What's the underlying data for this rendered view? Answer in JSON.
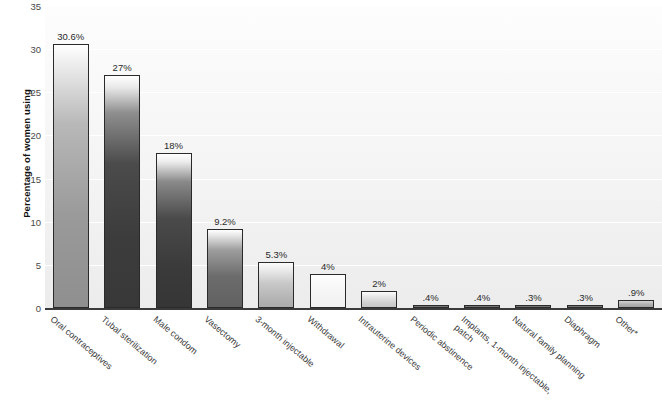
{
  "chart_data": {
    "type": "bar",
    "title": "",
    "xlabel": "",
    "ylabel": "Percentage of women using",
    "ylim": [
      0,
      35
    ],
    "yticks": [
      0,
      5,
      10,
      15,
      20,
      25,
      30,
      35
    ],
    "ytick_labels": [
      "0",
      "5",
      "10",
      "15",
      "20",
      "25",
      "30",
      "35"
    ],
    "grid": true,
    "legend": "none",
    "categories": [
      "Oral contraceptives",
      "Tubal sterilization",
      "Male condom",
      "Vasectomy",
      "3-month injectable",
      "Withdrawal",
      "Intrauterine devices",
      "Periodic abstinence",
      "Implants, 1-month injectable, patch",
      "Natural family planning",
      "Diaphragm",
      "Other*"
    ],
    "values": [
      30.6,
      27,
      18,
      9.2,
      5.3,
      4,
      2,
      0.4,
      0.4,
      0.3,
      0.3,
      0.9
    ],
    "value_labels": [
      "30.6%",
      "27%",
      "18%",
      "9.2%",
      "5.3%",
      "4%",
      "2%",
      ".4%",
      ".4%",
      ".3%",
      ".3%",
      ".9%"
    ]
  },
  "axis": {
    "y_title": "Percentage of women using"
  },
  "colors": {
    "plot_background": "#f4f4f4",
    "gridline": "#ffffff",
    "baseline": "#3b3b3b",
    "bar_outline": "#2a2a2a",
    "tick_text": "#4a4a4a",
    "label_text": "#3a3a3a"
  }
}
